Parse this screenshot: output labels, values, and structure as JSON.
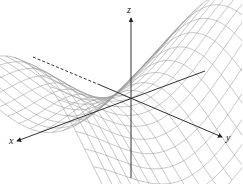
{
  "figure": {
    "background": "#ffffff",
    "mesh_color": "#9a9a9a",
    "axis_color": "#333333",
    "axes": {
      "x": {
        "label": "x",
        "label_pos": [
          9,
          136
        ],
        "from": [
          205,
          71
        ],
        "to": [
          17,
          141
        ]
      },
      "y": {
        "label": "y",
        "label_pos": [
          226,
          133
        ],
        "from": [
          33,
          57
        ],
        "to": [
          222,
          137
        ],
        "dashed_until": [
          100,
          85
        ]
      },
      "z": {
        "label": "z",
        "label_pos": [
          127,
          5
        ],
        "from": [
          131,
          178
        ],
        "to": [
          131,
          18
        ]
      }
    },
    "origin": [
      131,
      98
    ],
    "surface": {
      "type": "saddle-like wireframe",
      "grid_u": 18,
      "grid_v": 18,
      "domain": [
        -2,
        2
      ],
      "scale": 1.0
    }
  }
}
